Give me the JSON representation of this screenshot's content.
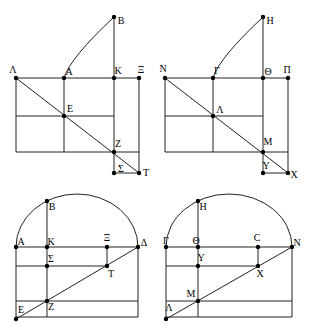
{
  "canvas": {
    "width": 312,
    "height": 334,
    "background": "#ffffff"
  },
  "style": {
    "line_color": "#222222",
    "dot_color": "#000000",
    "label_color": "#000000",
    "line_width": 1,
    "dot_radius": 2.2,
    "font_size": 10
  },
  "figures": [
    {
      "name": "top-left",
      "kind": "rectangle-grid-with-diagonal-and-curve",
      "points": [
        {
          "label": "B",
          "x": 114,
          "y": 17,
          "lx": 121,
          "ly": 20
        },
        {
          "label": "Λ",
          "x": 16,
          "y": 78,
          "lx": 13,
          "ly": 69
        },
        {
          "label": "A",
          "x": 64,
          "y": 78,
          "lx": 69,
          "ly": 71
        },
        {
          "label": "K",
          "x": 114,
          "y": 78,
          "lx": 118,
          "ly": 70
        },
        {
          "label": "Ξ",
          "x": 139,
          "y": 78,
          "lx": 141,
          "ly": 69
        },
        {
          "label": "E",
          "x": 64,
          "y": 116,
          "lx": 70,
          "ly": 108
        },
        {
          "label": "Z",
          "x": 114,
          "y": 152,
          "lx": 118,
          "ly": 143
        },
        {
          "label": "Σ",
          "x": 114,
          "y": 173,
          "lx": 121,
          "ly": 168
        },
        {
          "label": "T",
          "x": 139,
          "y": 173,
          "lx": 146,
          "ly": 172
        }
      ],
      "lines": [
        [
          16,
          78,
          139,
          78
        ],
        [
          16,
          116,
          114,
          116
        ],
        [
          16,
          152,
          139,
          152
        ],
        [
          114,
          173,
          139,
          173
        ],
        [
          16,
          78,
          16,
          152
        ],
        [
          64,
          78,
          64,
          152
        ],
        [
          114,
          17,
          114,
          173
        ],
        [
          139,
          78,
          139,
          173
        ],
        [
          16,
          78,
          139,
          173
        ]
      ],
      "curves": [
        {
          "from": [
            114,
            17
          ],
          "control": [
            70,
            58
          ],
          "to": [
            64,
            78
          ]
        }
      ],
      "arcs": []
    },
    {
      "name": "top-right",
      "kind": "rectangle-grid-with-diagonal-and-curve",
      "points": [
        {
          "label": "H",
          "x": 263,
          "y": 17,
          "lx": 270,
          "ly": 20
        },
        {
          "label": "N",
          "x": 165,
          "y": 78,
          "lx": 163,
          "ly": 68
        },
        {
          "label": "Γ",
          "x": 213,
          "y": 78,
          "lx": 217,
          "ly": 70
        },
        {
          "label": "Θ",
          "x": 263,
          "y": 78,
          "lx": 268,
          "ly": 71
        },
        {
          "label": "Π",
          "x": 288,
          "y": 78,
          "lx": 287,
          "ly": 69
        },
        {
          "label": "Λ",
          "x": 213,
          "y": 116,
          "lx": 220,
          "ly": 109
        },
        {
          "label": "M",
          "x": 263,
          "y": 152,
          "lx": 268,
          "ly": 141
        },
        {
          "label": "Y",
          "x": 263,
          "y": 173,
          "lx": 266,
          "ly": 165
        },
        {
          "label": "X",
          "x": 288,
          "y": 173,
          "lx": 294,
          "ly": 174
        }
      ],
      "lines": [
        [
          165,
          78,
          288,
          78
        ],
        [
          165,
          116,
          263,
          116
        ],
        [
          165,
          152,
          288,
          152
        ],
        [
          263,
          173,
          288,
          173
        ],
        [
          165,
          78,
          165,
          152
        ],
        [
          213,
          78,
          213,
          152
        ],
        [
          263,
          17,
          263,
          173
        ],
        [
          288,
          78,
          288,
          173
        ],
        [
          165,
          78,
          288,
          173
        ]
      ],
      "curves": [
        {
          "from": [
            263,
            17
          ],
          "control": [
            219,
            58
          ],
          "to": [
            213,
            78
          ]
        }
      ],
      "arcs": []
    },
    {
      "name": "bottom-left",
      "kind": "arched-rectangle-with-diagonal",
      "points": [
        {
          "label": "B",
          "x": 47,
          "y": 201,
          "lx": 52,
          "ly": 206
        },
        {
          "label": "A",
          "x": 16,
          "y": 247,
          "lx": 21,
          "ly": 241
        },
        {
          "label": "K",
          "x": 47,
          "y": 247,
          "lx": 51,
          "ly": 241
        },
        {
          "label": "Ξ",
          "x": 107,
          "y": 247,
          "lx": 107,
          "ly": 237
        },
        {
          "label": "Δ",
          "x": 138,
          "y": 247,
          "lx": 144,
          "ly": 242
        },
        {
          "label": "Σ",
          "x": 47,
          "y": 266,
          "lx": 51,
          "ly": 258
        },
        {
          "label": "T",
          "x": 107,
          "y": 266,
          "lx": 111,
          "ly": 273
        },
        {
          "label": "Z",
          "x": 47,
          "y": 301,
          "lx": 51,
          "ly": 306
        },
        {
          "label": "E",
          "x": 16,
          "y": 319,
          "lx": 21,
          "ly": 309
        }
      ],
      "lines": [
        [
          16,
          247,
          138,
          247
        ],
        [
          16,
          266,
          107,
          266
        ],
        [
          16,
          301,
          138,
          301
        ],
        [
          16,
          317,
          138,
          317
        ],
        [
          16,
          247,
          16,
          319
        ],
        [
          47,
          201,
          47,
          317
        ],
        [
          107,
          247,
          107,
          266
        ],
        [
          138,
          247,
          138,
          317
        ],
        [
          16,
          319,
          138,
          247
        ]
      ],
      "curves": [],
      "arcs": [
        {
          "from": [
            16,
            247
          ],
          "rx": 61,
          "ry": 53,
          "to": [
            138,
            247
          ]
        }
      ]
    },
    {
      "name": "bottom-right",
      "kind": "arched-rectangle-with-diagonal",
      "points": [
        {
          "label": "H",
          "x": 198,
          "y": 201,
          "lx": 203,
          "ly": 206
        },
        {
          "label": "Γ",
          "x": 166,
          "y": 247,
          "lx": 166,
          "ly": 240
        },
        {
          "label": "Θ",
          "x": 198,
          "y": 247,
          "lx": 196,
          "ly": 240
        },
        {
          "label": "C",
          "x": 258,
          "y": 247,
          "lx": 257,
          "ly": 237
        },
        {
          "label": "N",
          "x": 292,
          "y": 247,
          "lx": 297,
          "ly": 242
        },
        {
          "label": "Y",
          "x": 198,
          "y": 266,
          "lx": 201,
          "ly": 257
        },
        {
          "label": "X",
          "x": 258,
          "y": 266,
          "lx": 260,
          "ly": 273
        },
        {
          "label": "M",
          "x": 198,
          "y": 301,
          "lx": 191,
          "ly": 293
        },
        {
          "label": "Λ",
          "x": 166,
          "y": 319,
          "lx": 169,
          "ly": 307
        }
      ],
      "lines": [
        [
          166,
          247,
          292,
          247
        ],
        [
          166,
          266,
          258,
          266
        ],
        [
          166,
          301,
          292,
          301
        ],
        [
          166,
          317,
          292,
          317
        ],
        [
          166,
          247,
          166,
          319
        ],
        [
          198,
          201,
          198,
          317
        ],
        [
          258,
          247,
          258,
          266
        ],
        [
          292,
          247,
          292,
          317
        ],
        [
          166,
          319,
          292,
          247
        ]
      ],
      "curves": [],
      "arcs": [
        {
          "from": [
            166,
            247
          ],
          "rx": 63,
          "ry": 53,
          "to": [
            292,
            247
          ]
        }
      ]
    }
  ]
}
